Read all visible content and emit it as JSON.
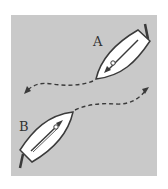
{
  "diagram": {
    "background_color": "#c9c9c9",
    "boat_fill": "#ffffff",
    "stroke_color": "#3a3a3a",
    "boats": [
      {
        "id": "A",
        "label": "A",
        "heading": "down-left"
      },
      {
        "id": "B",
        "label": "B",
        "heading": "up-right"
      }
    ],
    "paths": [
      {
        "from": "A",
        "direction": "left"
      },
      {
        "from": "B",
        "direction": "right"
      }
    ]
  }
}
